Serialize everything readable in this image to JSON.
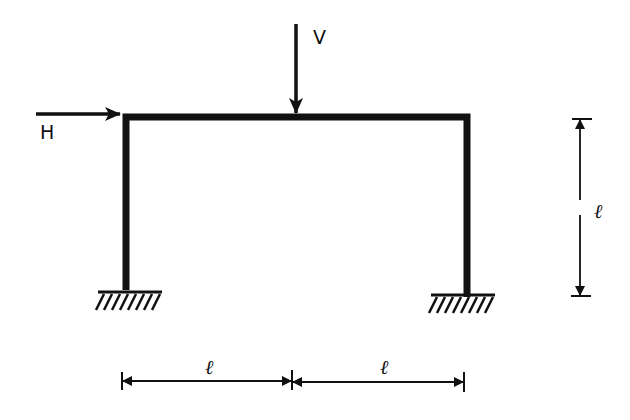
{
  "diagram": {
    "type": "portal frame with fixed supports",
    "loads": [
      {
        "name": "H",
        "direction": "horizontal, rightward",
        "applied_at": "top-left corner"
      },
      {
        "name": "V",
        "direction": "vertical, downward",
        "applied_at": "midspan of beam"
      }
    ],
    "dimensions": {
      "height_label": "ℓ",
      "span_left_label": "ℓ",
      "span_right_label": "ℓ"
    },
    "supports": [
      "fixed (left)",
      "fixed (right)"
    ],
    "colors": {
      "line": "#111111",
      "background": "#ffffff"
    }
  }
}
